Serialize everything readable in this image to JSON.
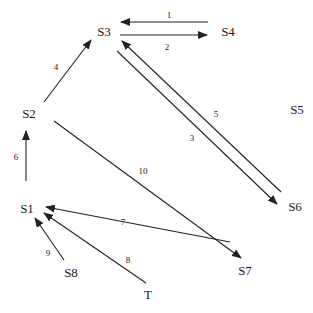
{
  "diagram": {
    "type": "state-transition-graph",
    "nodes": [
      {
        "id": "S1",
        "label": "S1",
        "x": 27,
        "y": 210
      },
      {
        "id": "S2",
        "label": "S2",
        "x": 29,
        "y": 115
      },
      {
        "id": "S3",
        "label": "S3",
        "x": 104,
        "y": 33
      },
      {
        "id": "S4",
        "label": "S4",
        "x": 228,
        "y": 33
      },
      {
        "id": "S5",
        "label": "S5",
        "x": 297,
        "y": 111
      },
      {
        "id": "S6",
        "label": "S6",
        "x": 295,
        "y": 208
      },
      {
        "id": "S7",
        "label": "S7",
        "x": 245,
        "y": 272
      },
      {
        "id": "S8",
        "label": "S8",
        "x": 71,
        "y": 274
      },
      {
        "id": "T",
        "label": "T",
        "x": 148,
        "y": 296
      }
    ],
    "edges": [
      {
        "id": "e1",
        "label": "1",
        "from": "S4",
        "to": "S3",
        "x1": 208,
        "y1": 22,
        "x2": 121,
        "y2": 22,
        "lx": 169,
        "ly": 18
      },
      {
        "id": "e2",
        "label": "2",
        "from": "S3",
        "to": "S4",
        "x1": 120,
        "y1": 35,
        "x2": 207,
        "y2": 35,
        "lx": 167,
        "ly": 50
      },
      {
        "id": "e3",
        "label": "3",
        "from": "S3",
        "to": "S6",
        "x1": 117,
        "y1": 51,
        "x2": 277,
        "y2": 204,
        "lx": 192,
        "ly": 141
      },
      {
        "id": "e4",
        "label": "4",
        "from": "S2",
        "to": "S3",
        "x1": 44,
        "y1": 102,
        "x2": 91,
        "y2": 40,
        "lx": 56,
        "ly": 70
      },
      {
        "id": "e5",
        "label": "5",
        "from": "S6",
        "to": "S3",
        "x1": 281,
        "y1": 192,
        "x2": 122,
        "y2": 41,
        "lx": 216,
        "ly": 117
      },
      {
        "id": "e6",
        "label": "6",
        "from": "S1",
        "to": "S2",
        "x1": 26,
        "y1": 181,
        "x2": 26,
        "y2": 131,
        "lx": 16,
        "ly": 160
      },
      {
        "id": "e7",
        "label": "7",
        "from": "S7",
        "to": "S1",
        "x1": 230,
        "y1": 242,
        "x2": 46,
        "y2": 207,
        "lx": 123,
        "ly": 225
      },
      {
        "id": "e8",
        "label": "8",
        "from": "T",
        "to": "S1",
        "x1": 146,
        "y1": 283,
        "x2": 44,
        "y2": 213,
        "lx": 128,
        "ly": 263
      },
      {
        "id": "e9",
        "label": "9",
        "from": "S8",
        "to": "S1",
        "x1": 64,
        "y1": 260,
        "x2": 35,
        "y2": 218,
        "lx": 48,
        "ly": 256
      },
      {
        "id": "e10",
        "label": "10",
        "from": "S2",
        "to": "S7",
        "x1": 54,
        "y1": 121,
        "x2": 241,
        "y2": 258,
        "lx": 143,
        "ly": 174
      }
    ],
    "colors": {
      "line": "#222222",
      "text": "#1a1a1a",
      "background": "#ffffff"
    }
  }
}
